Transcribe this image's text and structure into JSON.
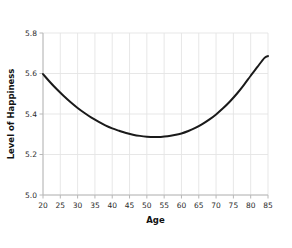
{
  "chart_data": {
    "type": "line",
    "title": "",
    "subtitle": "",
    "xlabel": "Age",
    "ylabel": "Level of Happiness",
    "xlim": [
      20,
      85
    ],
    "ylim": [
      5.0,
      5.8
    ],
    "grid": true,
    "legend": false,
    "legend_position": "none",
    "xticks": [
      20,
      25,
      30,
      35,
      40,
      45,
      50,
      55,
      60,
      65,
      70,
      75,
      80,
      85
    ],
    "xtick_labels": [
      "20",
      "25",
      "30",
      "35",
      "40",
      "45",
      "50",
      "55",
      "60",
      "65",
      "70",
      "75",
      "80",
      "85"
    ],
    "yticks": [
      5.0,
      5.2,
      5.4,
      5.6,
      5.8
    ],
    "ytick_labels": [
      "5.0",
      "5.2",
      "5.4",
      "5.6",
      "5.8"
    ],
    "series": [
      {
        "name": "Level of Happiness",
        "color": "#1a1a1a",
        "line_width": 2,
        "x": [
          20,
          22,
          24,
          26,
          28,
          30,
          32,
          34,
          36,
          38,
          40,
          42,
          44,
          46,
          48,
          50,
          52,
          54,
          56,
          58,
          60,
          62,
          64,
          66,
          68,
          70,
          72,
          74,
          76,
          78,
          80,
          82,
          84,
          85
        ],
        "values": [
          5.597,
          5.558,
          5.522,
          5.489,
          5.458,
          5.43,
          5.405,
          5.382,
          5.362,
          5.344,
          5.329,
          5.317,
          5.306,
          5.298,
          5.292,
          5.288,
          5.286,
          5.287,
          5.29,
          5.296,
          5.304,
          5.316,
          5.331,
          5.35,
          5.372,
          5.398,
          5.428,
          5.462,
          5.5,
          5.543,
          5.589,
          5.634,
          5.677,
          5.686
        ]
      }
    ],
    "annotations": [],
    "style": {
      "grid_color": "#e4e4e4",
      "axis_color": "#b8b8b8",
      "background": "#ffffff",
      "tick_label_color": "#2b2b2b",
      "axis_title_color": "#111111"
    }
  }
}
